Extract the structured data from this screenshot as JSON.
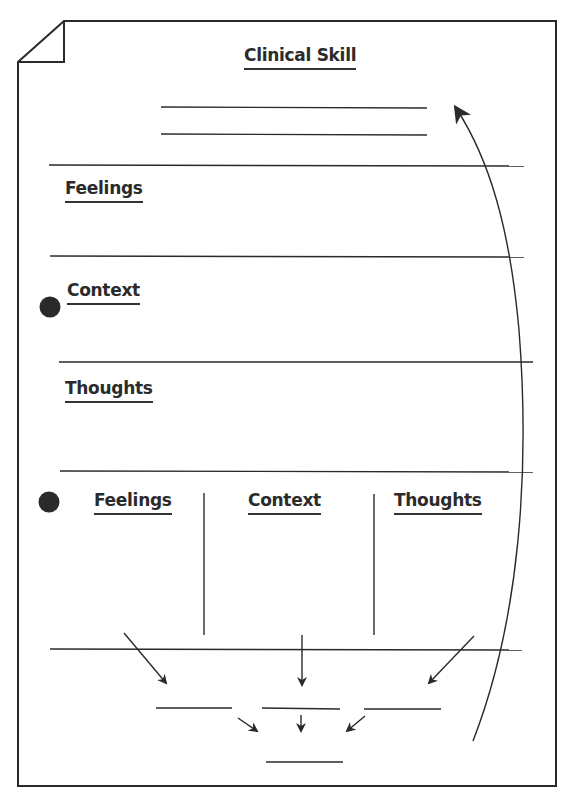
{
  "title": "Clinical Skill",
  "sections": [
    {
      "label": "Feelings"
    },
    {
      "label": "Context",
      "bullet": true
    },
    {
      "label": "Thoughts"
    }
  ],
  "columns": {
    "bullet": true,
    "items": [
      {
        "label": "Feelings"
      },
      {
        "label": "Context"
      },
      {
        "label": "Thoughts"
      }
    ]
  },
  "icons": {
    "bullet": "filled-circle",
    "feedback_arrow": "curved-arrow-up",
    "converge_arrows": "arrows-down"
  },
  "colors": {
    "ink": "#2a2a2a",
    "paper": "#ffffff"
  }
}
